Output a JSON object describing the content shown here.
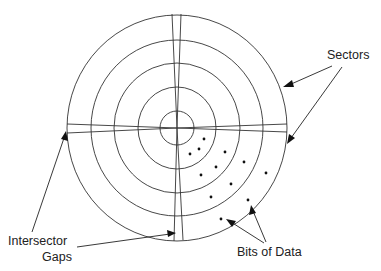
{
  "labels": {
    "sectors": "Sectors",
    "intersector_line1": "Intersector",
    "intersector_line2": "Gaps",
    "bits_of_data": "Bits of Data"
  },
  "colors": {
    "stroke": "#333333",
    "text": "#222222",
    "background": "#ffffff"
  },
  "disk": {
    "center": [
      177,
      128
    ],
    "track_radii": [
      110,
      86,
      63,
      39,
      16
    ],
    "track_count": 5
  },
  "data_bits": [
    [
      204,
      139
    ],
    [
      199,
      149
    ],
    [
      190,
      154
    ],
    [
      225,
      152
    ],
    [
      216,
      167
    ],
    [
      244,
      162
    ],
    [
      201,
      175
    ],
    [
      231,
      184
    ],
    [
      266,
      173
    ],
    [
      211,
      197
    ],
    [
      248,
      200
    ],
    [
      221,
      219
    ]
  ]
}
